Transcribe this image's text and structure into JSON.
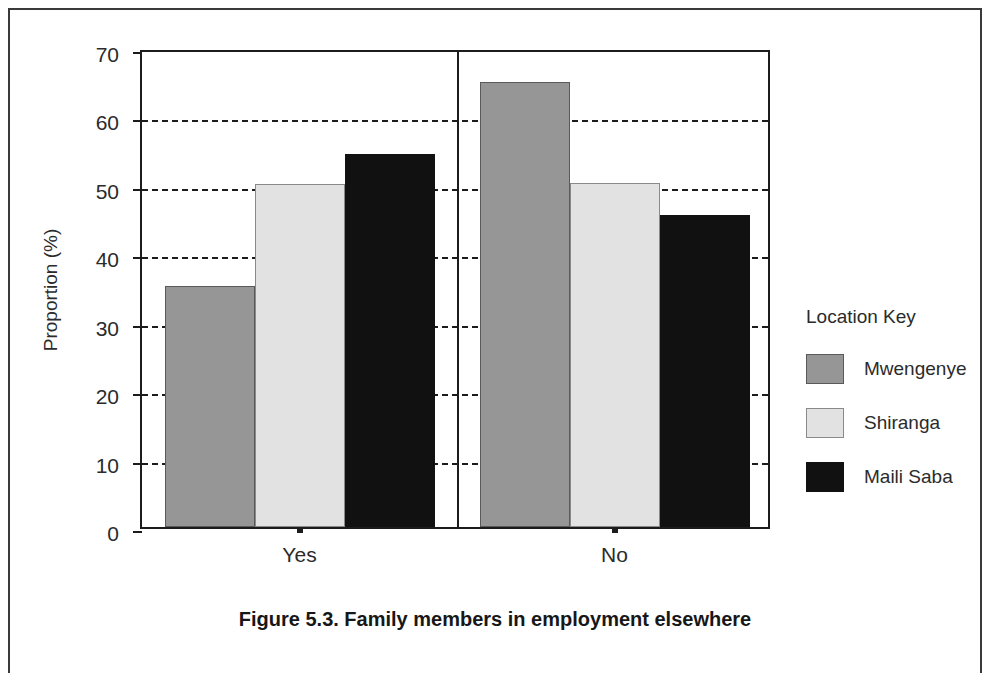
{
  "caption": "Figure 5.3. Family members in employment elsewhere",
  "legend": {
    "title": "Location Key",
    "entries": [
      {
        "label": "Mwengenye",
        "color": "#969696"
      },
      {
        "label": "Shiranga",
        "color": "#e2e2e2"
      },
      {
        "label": "Maili Saba",
        "color": "#111111"
      }
    ]
  },
  "axes": {
    "y_title": "Proportion (%)",
    "y_ticks": [
      "0",
      "10",
      "20",
      "30",
      "40",
      "50",
      "60",
      "70"
    ],
    "x_ticks": [
      "Yes",
      "No"
    ]
  },
  "chart_data": {
    "type": "bar",
    "title": "Figure 5.3. Family members in employment elsewhere",
    "xlabel": "",
    "ylabel": "Proportion (%)",
    "ylim": [
      0,
      70
    ],
    "ytick_step": 10,
    "grid": true,
    "grid_style": "dashed-horizontal",
    "legend_position": "right",
    "legend_title": "Location Key",
    "categories": [
      "Yes",
      "No"
    ],
    "series": [
      {
        "name": "Mwengenye",
        "color": "#969696",
        "values": [
          35.2,
          65.0
        ]
      },
      {
        "name": "Shiranga",
        "color": "#e2e2e2",
        "values": [
          50.2,
          50.3
        ]
      },
      {
        "name": "Maili Saba",
        "color": "#111111",
        "values": [
          54.5,
          45.6
        ]
      }
    ]
  }
}
